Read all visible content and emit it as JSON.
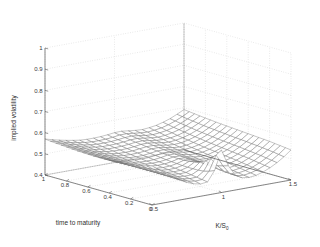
{
  "figure": {
    "title": "",
    "background": "#ffffff",
    "mesh_color": "#6f6f6f",
    "grid_color": "#c9c9c9",
    "axis_color": "#555555"
  },
  "chart_data": {
    "type": "surface",
    "title": "",
    "xlabel": "K/S",
    "xlabel_sub": "0",
    "ylabel": "time to maturity",
    "zlabel": "implied volatility",
    "xticks": [
      0.5,
      1,
      1.5
    ],
    "xtick_labels": [
      "0.5",
      "1",
      "1.5"
    ],
    "yticks": [
      0,
      0.2,
      0.4,
      0.6,
      0.8,
      1
    ],
    "ytick_labels": [
      "0",
      "0.2",
      "0.4",
      "0.6",
      "0.8",
      "1"
    ],
    "zticks": [
      0.4,
      0.5,
      0.6,
      0.7,
      0.8,
      0.9,
      1
    ],
    "ztick_labels": [
      "0.4",
      "0.5",
      "0.6",
      "0.7",
      "0.8",
      "0.9",
      "1"
    ],
    "xlim": [
      0.5,
      1.5
    ],
    "ylim": [
      0,
      1
    ],
    "zlim": [
      0.4,
      1.0
    ],
    "grid": true,
    "legend": "none",
    "x": [
      0.5,
      0.55,
      0.6,
      0.65,
      0.7,
      0.75,
      0.8,
      0.85,
      0.9,
      0.95,
      1.0,
      1.05,
      1.1,
      1.15,
      1.2,
      1.25,
      1.3,
      1.35,
      1.4,
      1.45,
      1.5
    ],
    "y": [
      0.0,
      0.05,
      0.1,
      0.15,
      0.2,
      0.25,
      0.3,
      0.35,
      0.4,
      0.45,
      0.5,
      0.55,
      0.6,
      0.65,
      0.7,
      0.75,
      0.8,
      0.85,
      0.9,
      0.95,
      1.0
    ],
    "z_description": "implied volatility surface: sharp at-the-money ridge at short maturity near K/S0=1, smile flattening and rising toward long maturity and deep strikes",
    "z": [
      [
        0.585,
        0.56,
        0.536,
        0.514,
        0.495,
        0.478,
        0.465,
        0.458,
        0.462,
        0.51,
        0.6,
        0.52,
        0.47,
        0.452,
        0.448,
        0.452,
        0.462,
        0.476,
        0.494,
        0.516,
        0.542
      ],
      [
        0.578,
        0.556,
        0.534,
        0.514,
        0.496,
        0.481,
        0.47,
        0.464,
        0.466,
        0.5,
        0.57,
        0.512,
        0.47,
        0.454,
        0.451,
        0.456,
        0.466,
        0.48,
        0.498,
        0.52,
        0.545
      ],
      [
        0.572,
        0.552,
        0.532,
        0.513,
        0.497,
        0.484,
        0.474,
        0.469,
        0.47,
        0.493,
        0.545,
        0.506,
        0.472,
        0.458,
        0.455,
        0.46,
        0.47,
        0.484,
        0.502,
        0.524,
        0.548
      ],
      [
        0.567,
        0.549,
        0.53,
        0.513,
        0.498,
        0.486,
        0.478,
        0.473,
        0.474,
        0.49,
        0.528,
        0.502,
        0.475,
        0.462,
        0.459,
        0.464,
        0.474,
        0.488,
        0.506,
        0.527,
        0.551
      ],
      [
        0.563,
        0.546,
        0.529,
        0.513,
        0.499,
        0.488,
        0.481,
        0.477,
        0.478,
        0.49,
        0.516,
        0.5,
        0.478,
        0.466,
        0.463,
        0.468,
        0.478,
        0.492,
        0.509,
        0.53,
        0.554
      ],
      [
        0.56,
        0.544,
        0.528,
        0.513,
        0.5,
        0.49,
        0.483,
        0.48,
        0.481,
        0.49,
        0.509,
        0.499,
        0.481,
        0.47,
        0.467,
        0.472,
        0.482,
        0.495,
        0.512,
        0.533,
        0.556
      ],
      [
        0.558,
        0.543,
        0.528,
        0.514,
        0.502,
        0.492,
        0.486,
        0.483,
        0.484,
        0.491,
        0.505,
        0.499,
        0.484,
        0.474,
        0.471,
        0.476,
        0.485,
        0.498,
        0.515,
        0.535,
        0.558
      ],
      [
        0.556,
        0.542,
        0.528,
        0.515,
        0.503,
        0.494,
        0.488,
        0.486,
        0.487,
        0.493,
        0.503,
        0.5,
        0.487,
        0.478,
        0.475,
        0.479,
        0.488,
        0.501,
        0.518,
        0.538,
        0.56
      ],
      [
        0.555,
        0.541,
        0.528,
        0.516,
        0.505,
        0.496,
        0.491,
        0.489,
        0.49,
        0.495,
        0.503,
        0.501,
        0.49,
        0.482,
        0.479,
        0.483,
        0.491,
        0.504,
        0.52,
        0.54,
        0.562
      ],
      [
        0.554,
        0.541,
        0.529,
        0.517,
        0.507,
        0.499,
        0.494,
        0.492,
        0.493,
        0.497,
        0.504,
        0.503,
        0.493,
        0.486,
        0.483,
        0.486,
        0.495,
        0.507,
        0.523,
        0.542,
        0.564
      ],
      [
        0.554,
        0.542,
        0.53,
        0.519,
        0.509,
        0.501,
        0.496,
        0.495,
        0.496,
        0.5,
        0.506,
        0.505,
        0.497,
        0.49,
        0.487,
        0.49,
        0.498,
        0.51,
        0.525,
        0.544,
        0.566
      ],
      [
        0.554,
        0.542,
        0.531,
        0.521,
        0.511,
        0.504,
        0.499,
        0.498,
        0.499,
        0.503,
        0.508,
        0.508,
        0.5,
        0.494,
        0.491,
        0.494,
        0.501,
        0.513,
        0.528,
        0.547,
        0.568
      ],
      [
        0.555,
        0.544,
        0.533,
        0.523,
        0.514,
        0.507,
        0.503,
        0.501,
        0.502,
        0.506,
        0.511,
        0.511,
        0.504,
        0.498,
        0.495,
        0.498,
        0.505,
        0.516,
        0.531,
        0.549,
        0.57
      ],
      [
        0.556,
        0.545,
        0.535,
        0.525,
        0.516,
        0.51,
        0.506,
        0.505,
        0.506,
        0.509,
        0.514,
        0.514,
        0.508,
        0.502,
        0.499,
        0.502,
        0.509,
        0.52,
        0.534,
        0.552,
        0.572
      ],
      [
        0.557,
        0.547,
        0.537,
        0.528,
        0.519,
        0.513,
        0.509,
        0.508,
        0.509,
        0.513,
        0.517,
        0.517,
        0.512,
        0.506,
        0.504,
        0.506,
        0.513,
        0.523,
        0.537,
        0.554,
        0.574
      ],
      [
        0.559,
        0.549,
        0.539,
        0.53,
        0.522,
        0.516,
        0.513,
        0.512,
        0.513,
        0.516,
        0.521,
        0.521,
        0.516,
        0.511,
        0.508,
        0.511,
        0.517,
        0.527,
        0.54,
        0.557,
        0.577
      ],
      [
        0.561,
        0.551,
        0.542,
        0.533,
        0.525,
        0.52,
        0.516,
        0.516,
        0.517,
        0.52,
        0.524,
        0.525,
        0.52,
        0.515,
        0.513,
        0.515,
        0.521,
        0.531,
        0.544,
        0.56,
        0.579
      ],
      [
        0.563,
        0.553,
        0.544,
        0.536,
        0.529,
        0.523,
        0.52,
        0.52,
        0.521,
        0.524,
        0.528,
        0.529,
        0.524,
        0.52,
        0.517,
        0.52,
        0.526,
        0.535,
        0.548,
        0.564,
        0.582
      ],
      [
        0.565,
        0.556,
        0.547,
        0.539,
        0.532,
        0.527,
        0.524,
        0.524,
        0.525,
        0.528,
        0.532,
        0.533,
        0.529,
        0.524,
        0.522,
        0.525,
        0.53,
        0.539,
        0.552,
        0.567,
        0.585
      ],
      [
        0.567,
        0.558,
        0.55,
        0.542,
        0.536,
        0.531,
        0.528,
        0.528,
        0.529,
        0.532,
        0.537,
        0.537,
        0.533,
        0.529,
        0.527,
        0.53,
        0.535,
        0.544,
        0.556,
        0.571,
        0.588
      ],
      [
        0.57,
        0.561,
        0.553,
        0.546,
        0.54,
        0.535,
        0.533,
        0.533,
        0.534,
        0.537,
        0.541,
        0.542,
        0.538,
        0.534,
        0.532,
        0.535,
        0.54,
        0.549,
        0.56,
        0.575,
        0.591
      ]
    ]
  }
}
